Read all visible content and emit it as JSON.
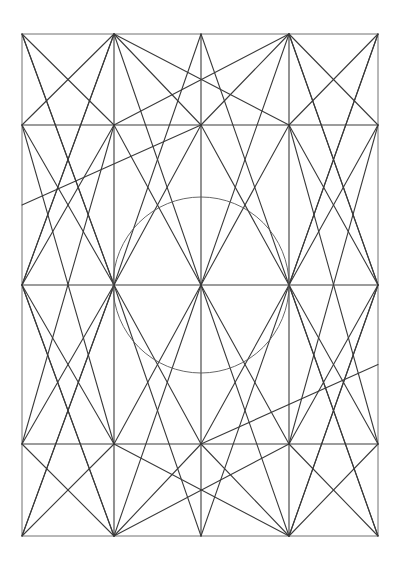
{
  "figure": {
    "title": "",
    "stroke_color": "#3a3a3a",
    "background": "#ffffff"
  },
  "grid": {
    "columns": [
      22,
      114,
      201,
      289,
      378
    ],
    "rows": [
      34,
      125,
      285,
      444,
      536
    ]
  },
  "circle": {
    "cx": 201,
    "cy": 285,
    "r": 88
  },
  "lines": [
    [
      0,
      0,
      4,
      0
    ],
    [
      4,
      0,
      4,
      4
    ],
    [
      4,
      4,
      0,
      4
    ],
    [
      0,
      4,
      0,
      0
    ],
    [
      1,
      0,
      1,
      4
    ],
    [
      2,
      0,
      2,
      4
    ],
    [
      3,
      0,
      3,
      4
    ],
    [
      0,
      1,
      4,
      1
    ],
    [
      0,
      2,
      4,
      2
    ],
    [
      0,
      3,
      4,
      3
    ],
    [
      1,
      0,
      0,
      1
    ],
    [
      1,
      0,
      2,
      1
    ],
    [
      1,
      0,
      3,
      1
    ],
    [
      1,
      0,
      0,
      2
    ],
    [
      1,
      0,
      2,
      2
    ],
    [
      3,
      0,
      4,
      1
    ],
    [
      3,
      0,
      2,
      1
    ],
    [
      3,
      0,
      1,
      1
    ],
    [
      3,
      0,
      4,
      2
    ],
    [
      3,
      0,
      2,
      2
    ],
    [
      0,
      0,
      1,
      1
    ],
    [
      0,
      0,
      1,
      2
    ],
    [
      4,
      0,
      3,
      1
    ],
    [
      4,
      0,
      3,
      2
    ],
    [
      1,
      4,
      0,
      3
    ],
    [
      1,
      4,
      2,
      3
    ],
    [
      1,
      4,
      3,
      3
    ],
    [
      1,
      4,
      0,
      2
    ],
    [
      1,
      4,
      2,
      2
    ],
    [
      3,
      4,
      4,
      3
    ],
    [
      3,
      4,
      2,
      3
    ],
    [
      3,
      4,
      1,
      3
    ],
    [
      3,
      4,
      4,
      2
    ],
    [
      3,
      4,
      2,
      2
    ],
    [
      0,
      4,
      1,
      3
    ],
    [
      0,
      4,
      1,
      2
    ],
    [
      4,
      4,
      3,
      3
    ],
    [
      4,
      4,
      3,
      2
    ],
    [
      1,
      1,
      0,
      2
    ],
    [
      1,
      1,
      2,
      2
    ],
    [
      3,
      1,
      4,
      2
    ],
    [
      3,
      1,
      2,
      2
    ],
    [
      1,
      3,
      0,
      2
    ],
    [
      1,
      3,
      2,
      2
    ],
    [
      3,
      3,
      4,
      2
    ],
    [
      3,
      3,
      2,
      2
    ],
    [
      2,
      1,
      1,
      2
    ],
    [
      2,
      1,
      3,
      2
    ],
    [
      2,
      3,
      1,
      2
    ],
    [
      2,
      3,
      3,
      2
    ],
    [
      0,
      1,
      1,
      2
    ],
    [
      4,
      1,
      3,
      2
    ],
    [
      0,
      3,
      1,
      2
    ],
    [
      4,
      3,
      3,
      2
    ],
    [
      1,
      1,
      0,
      3
    ],
    [
      3,
      1,
      4,
      3
    ],
    [
      1,
      3,
      0,
      1
    ],
    [
      3,
      3,
      4,
      1
    ],
    [
      1,
      2,
      0,
      0
    ],
    [
      3,
      2,
      4,
      0
    ],
    [
      1,
      2,
      0,
      4
    ],
    [
      3,
      2,
      4,
      4
    ],
    [
      1,
      2,
      2,
      0
    ],
    [
      3,
      2,
      2,
      0
    ],
    [
      1,
      2,
      2,
      4
    ],
    [
      3,
      2,
      2,
      4
    ],
    [
      0,
      2,
      1,
      0
    ],
    [
      4,
      2,
      3,
      0
    ],
    [
      0,
      2,
      1,
      4
    ],
    [
      4,
      2,
      3,
      4
    ],
    [
      2,
      1,
      0,
      1.5
    ],
    [
      2,
      3,
      4,
      2.5
    ]
  ],
  "chart_data": {
    "type": "diagram",
    "title": "",
    "nodes": [
      {
        "id": "TL",
        "x": 22,
        "y": 34
      },
      {
        "id": "T1",
        "x": 114,
        "y": 34
      },
      {
        "id": "T2",
        "x": 201,
        "y": 34
      },
      {
        "id": "T3",
        "x": 289,
        "y": 34
      },
      {
        "id": "TR",
        "x": 378,
        "y": 34
      },
      {
        "id": "ML",
        "x": 114,
        "y": 285
      },
      {
        "id": "MC",
        "x": 201,
        "y": 285
      },
      {
        "id": "MR",
        "x": 289,
        "y": 285
      },
      {
        "id": "BL",
        "x": 22,
        "y": 536
      },
      {
        "id": "B1",
        "x": 114,
        "y": 536
      },
      {
        "id": "B2",
        "x": 201,
        "y": 536
      },
      {
        "id": "B3",
        "x": 289,
        "y": 536
      },
      {
        "id": "BR",
        "x": 378,
        "y": 536
      }
    ],
    "circle": {
      "cx": 201,
      "cy": 285,
      "r": 88
    }
  }
}
